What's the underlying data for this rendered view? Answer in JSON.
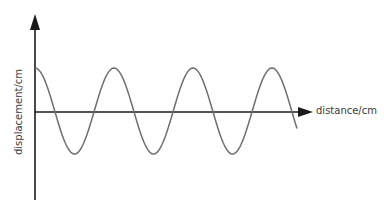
{
  "diagram": {
    "type": "transverse wave displacement-distance graph",
    "x_axis_label": "distance/cm",
    "y_axis_label": "displacement/cm",
    "wave": {
      "shape": "cosine",
      "cycles_shown": 3.3,
      "starts_at": "maximum positive displacement",
      "color": "#6e6e6e"
    },
    "axis_color": "#1a1a1a"
  }
}
